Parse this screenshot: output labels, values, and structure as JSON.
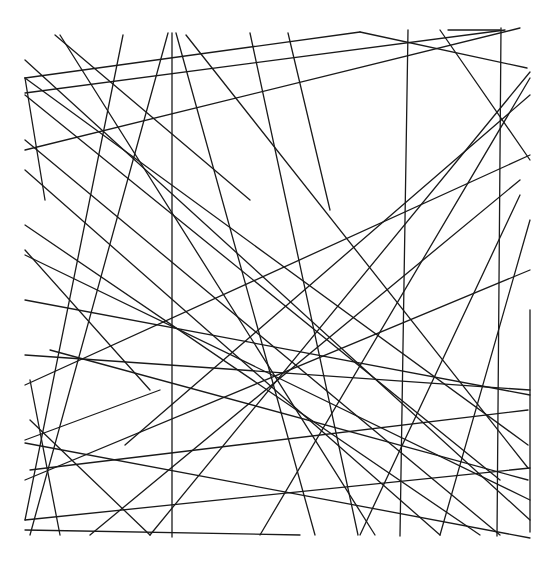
{
  "artwork": {
    "width": 555,
    "height": 572,
    "background": "#ffffff",
    "stroke": "#1a1a1a",
    "lines": [
      [
        172,
        33,
        172,
        537
      ],
      [
        408,
        30,
        400,
        536
      ],
      [
        501,
        28,
        497,
        536
      ],
      [
        530,
        310,
        530,
        532
      ],
      [
        25,
        78,
        360,
        32
      ],
      [
        25,
        93,
        505,
        30
      ],
      [
        360,
        32,
        527,
        68
      ],
      [
        448,
        30,
        500,
        30
      ],
      [
        25,
        78,
        45,
        200
      ],
      [
        60,
        35,
        375,
        535
      ],
      [
        55,
        35,
        250,
        200
      ],
      [
        123,
        35,
        25,
        520
      ],
      [
        168,
        33,
        30,
        535
      ],
      [
        176,
        33,
        315,
        535
      ],
      [
        186,
        35,
        528,
        468
      ],
      [
        250,
        33,
        358,
        535
      ],
      [
        288,
        33,
        330,
        210
      ],
      [
        25,
        60,
        530,
        520
      ],
      [
        25,
        78,
        528,
        445
      ],
      [
        25,
        95,
        500,
        480
      ],
      [
        25,
        140,
        500,
        535
      ],
      [
        25,
        170,
        440,
        535
      ],
      [
        25,
        225,
        480,
        535
      ],
      [
        25,
        250,
        150,
        390
      ],
      [
        25,
        300,
        530,
        395
      ],
      [
        25,
        355,
        530,
        390
      ],
      [
        25,
        385,
        530,
        155
      ],
      [
        25,
        440,
        160,
        390
      ],
      [
        25,
        480,
        530,
        270
      ],
      [
        25,
        520,
        530,
        468
      ],
      [
        25,
        530,
        300,
        535
      ],
      [
        25,
        443,
        530,
        538
      ],
      [
        25,
        150,
        520,
        28
      ],
      [
        125,
        445,
        530,
        95
      ],
      [
        150,
        535,
        530,
        72
      ],
      [
        260,
        535,
        530,
        78
      ],
      [
        360,
        535,
        520,
        195
      ],
      [
        440,
        535,
        530,
        220
      ],
      [
        440,
        30,
        530,
        160
      ],
      [
        30,
        470,
        528,
        410
      ],
      [
        50,
        350,
        528,
        480
      ],
      [
        30,
        380,
        60,
        535
      ],
      [
        90,
        535,
        520,
        180
      ],
      [
        25,
        255,
        530,
        500
      ],
      [
        30,
        420,
        150,
        535
      ]
    ]
  }
}
